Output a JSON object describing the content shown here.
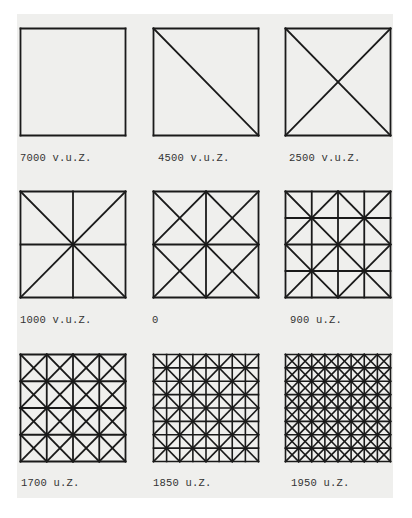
{
  "figure": {
    "panels": [
      {
        "label": "7000 v.u.Z.",
        "pattern": "empty",
        "grid": 1,
        "diag": "none"
      },
      {
        "label": "4500 v.u.Z.",
        "pattern": "single-diagonal",
        "grid": 1,
        "diag": "single"
      },
      {
        "label": "2500 v.u.Z.",
        "pattern": "x",
        "grid": 1,
        "diag": "x-cells"
      },
      {
        "label": "1000 v.u.Z.",
        "pattern": "grid2-with-x",
        "grid": 2,
        "diag": "x-whole"
      },
      {
        "label": "0",
        "pattern": "grid2-x-per-cell",
        "grid": 2,
        "diag": "x-cells"
      },
      {
        "label": "900 u.Z.",
        "pattern": "grid4-diamond",
        "grid": 4,
        "diag": "x-blocks2"
      },
      {
        "label": "1700 u.Z.",
        "pattern": "grid4-x-per-cell",
        "grid": 4,
        "diag": "x-cells"
      },
      {
        "label": "1850 u.Z.",
        "pattern": "grid8-diamond",
        "grid": 8,
        "diag": "x-blocks2"
      },
      {
        "label": "1950 u.Z.",
        "pattern": "grid8-x-per-cell",
        "grid": 8,
        "diag": "x-cells"
      }
    ],
    "line_color": "#1a1a1a",
    "paper_color": "#efefed"
  }
}
